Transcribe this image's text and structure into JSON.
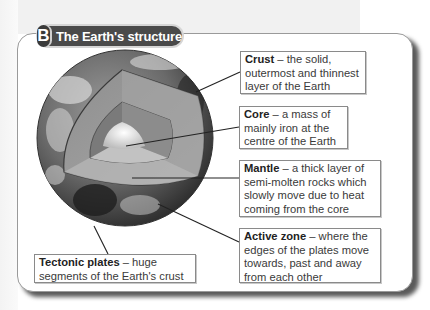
{
  "header": {
    "badge": "B",
    "title": "The Earth's structure"
  },
  "labels": {
    "crust": {
      "term": "Crust",
      "text": " – the solid, outermost and thinnest layer of the Earth"
    },
    "core": {
      "term": "Core",
      "text": " – a mass of mainly iron at the centre of the Earth"
    },
    "mantle": {
      "term": "Mantle",
      "text": " – a thick layer of semi-molten rocks which slowly move due to heat coming from the core"
    },
    "active_zone": {
      "term": "Active zone",
      "text": " – where the edges of the plates move towards, past and away from each other"
    },
    "tectonic_plates": {
      "term": "Tectonic plates",
      "text": " – huge segments of the Earth's crust"
    }
  }
}
